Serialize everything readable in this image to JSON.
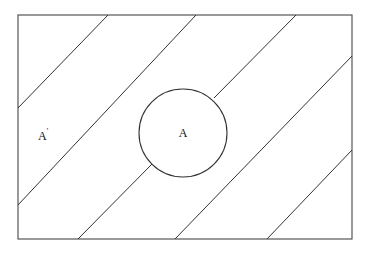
{
  "diagram": {
    "type": "venn",
    "universe": {
      "x": 18,
      "y": 15,
      "w": 334,
      "h": 224
    },
    "set": {
      "label": "A",
      "cx": 183,
      "cy": 133,
      "r": 44
    },
    "complement": {
      "label": "A",
      "prime": "'"
    },
    "hatch_lines": [
      {
        "x1": 18,
        "y1": 108,
        "x2": 108,
        "y2": 15
      },
      {
        "x1": 18,
        "y1": 205,
        "x2": 196,
        "y2": 15
      },
      {
        "x1": 78,
        "y1": 239,
        "x2": 152,
        "y2": 164
      },
      {
        "x1": 214,
        "y1": 98,
        "x2": 296,
        "y2": 15
      },
      {
        "x1": 175,
        "y1": 239,
        "x2": 352,
        "y2": 56
      },
      {
        "x1": 267,
        "y1": 239,
        "x2": 352,
        "y2": 150
      }
    ],
    "stroke_color": "#333333"
  }
}
